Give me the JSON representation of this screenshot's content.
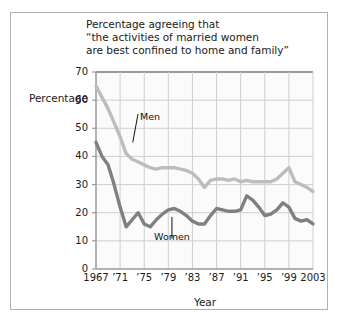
{
  "figure": {
    "title_lines": [
      "Percentage agreeing that",
      "“the activities of married women",
      "are best confined to home and family”"
    ],
    "axis_label_y": "Percentage",
    "axis_label_x": "Year"
  },
  "chart_data": {
    "type": "line",
    "title": "Percentage agreeing that “the activities of married women are best confined to home and family”",
    "xlabel": "Year",
    "ylabel": "Percentage",
    "xlim": [
      1967,
      2003
    ],
    "ylim": [
      0,
      70
    ],
    "yticks": [
      0,
      10,
      20,
      30,
      40,
      50,
      60,
      70
    ],
    "ytick_labels": [
      "0",
      "10",
      "20",
      "30",
      "40",
      "50",
      "60",
      "70"
    ],
    "xticks": [
      1967,
      1971,
      1975,
      1979,
      1983,
      1987,
      1991,
      1995,
      1999,
      2003
    ],
    "xtick_labels": [
      "1967",
      "’71",
      "’75",
      "’79",
      "’83",
      "’87",
      "’91",
      "’95",
      "’99",
      "2003"
    ],
    "grid": true,
    "legend": "inline-annotations",
    "colors": {
      "men": "#bdbdbd",
      "women": "#808080",
      "grid": "#cfcfcf",
      "axis": "#9a9a9a"
    },
    "x": [
      1967,
      1968,
      1969,
      1970,
      1971,
      1972,
      1973,
      1974,
      1975,
      1976,
      1977,
      1978,
      1979,
      1980,
      1981,
      1982,
      1983,
      1984,
      1985,
      1986,
      1987,
      1988,
      1989,
      1990,
      1991,
      1992,
      1993,
      1994,
      1995,
      1996,
      1997,
      1998,
      1999,
      2000,
      2001,
      2002,
      2003
    ],
    "series": [
      {
        "name": "Men",
        "color": "#bdbdbd",
        "values": [
          65,
          61,
          57,
          52,
          47,
          41,
          39,
          38,
          37,
          36,
          35.5,
          36,
          36,
          36,
          35.5,
          35,
          34,
          32,
          29,
          31.5,
          32,
          32,
          31.5,
          32,
          31,
          31.5,
          31,
          31,
          31,
          31,
          32,
          34,
          36,
          31,
          30,
          29,
          27.5
        ]
      },
      {
        "name": "Women",
        "color": "#808080",
        "values": [
          45,
          40,
          37,
          30,
          22,
          15,
          17.5,
          20,
          16,
          15,
          17.5,
          19.5,
          21,
          21.5,
          20.5,
          19,
          17,
          16,
          16,
          19,
          21.5,
          21,
          20.5,
          20.5,
          21,
          26,
          24.5,
          22,
          19,
          19.5,
          21,
          23.5,
          22,
          18,
          17,
          17.5,
          16
        ]
      }
    ],
    "annotations": [
      {
        "text": "Men",
        "x": 1974.3,
        "y": 54,
        "points_to": {
          "x": 1973.1,
          "y": 45
        }
      },
      {
        "text": "Women",
        "x": 1979.6,
        "y": 11.5,
        "points_to": {
          "x": 1979.6,
          "y": 18.5
        }
      }
    ]
  }
}
